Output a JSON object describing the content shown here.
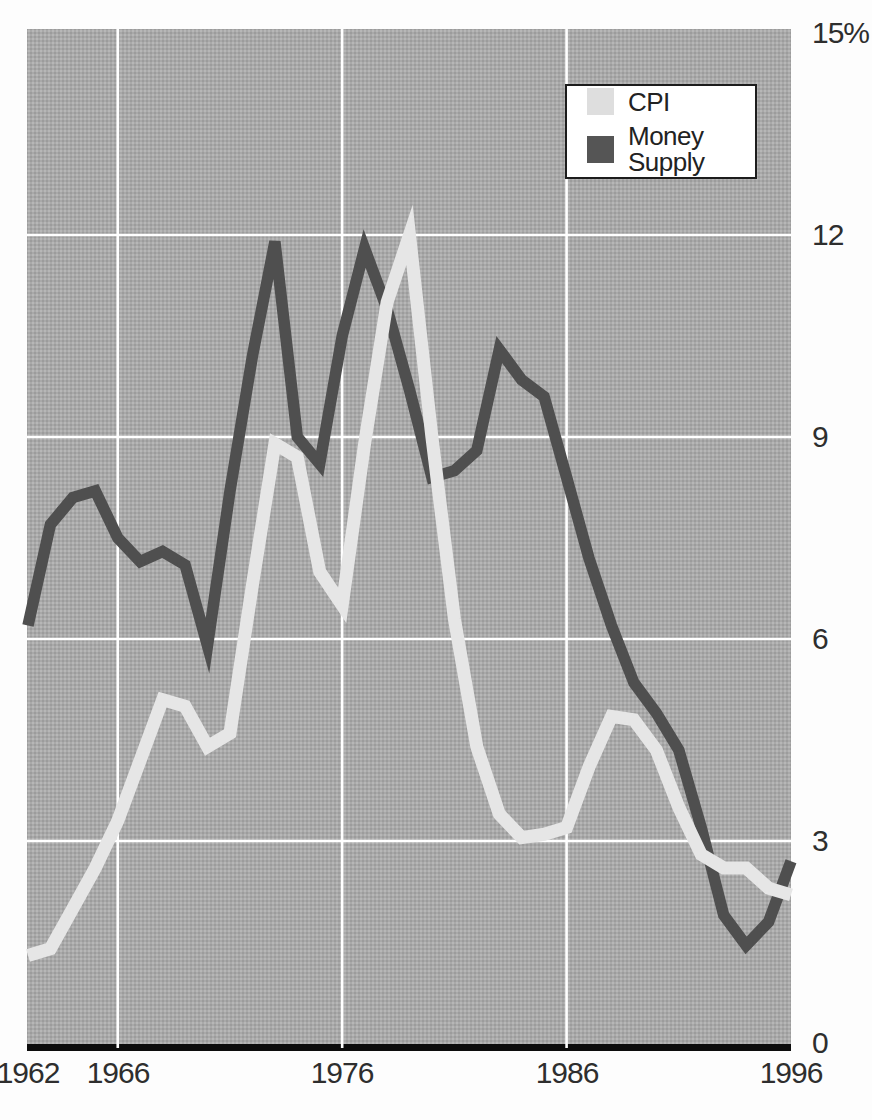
{
  "chart_data": {
    "type": "line",
    "title": "",
    "xlabel": "",
    "ylabel": "",
    "xlim": [
      1962,
      1996
    ],
    "ylim": [
      0,
      15
    ],
    "grid_on": true,
    "legend_position": "top-right",
    "plot_bg_color": "#a9a9a9",
    "grid_color": "#ffffff",
    "baseline_color": "#0d0d0d",
    "x": [
      1962,
      1963,
      1964,
      1965,
      1966,
      1967,
      1968,
      1969,
      1970,
      1971,
      1972,
      1973,
      1974,
      1975,
      1976,
      1977,
      1978,
      1979,
      1980,
      1981,
      1982,
      1983,
      1984,
      1985,
      1986,
      1987,
      1988,
      1989,
      1990,
      1991,
      1992,
      1993,
      1994,
      1995,
      1996
    ],
    "series": [
      {
        "name": "CPI",
        "color": "#e6e6e6",
        "values": [
          1.3,
          1.4,
          2.0,
          2.6,
          3.3,
          4.2,
          5.1,
          5.0,
          4.4,
          4.6,
          6.8,
          8.9,
          8.7,
          7.0,
          6.5,
          8.9,
          11.0,
          12.0,
          9.0,
          6.3,
          4.4,
          3.4,
          3.05,
          3.1,
          3.2,
          4.1,
          4.85,
          4.8,
          4.35,
          3.5,
          2.8,
          2.6,
          2.6,
          2.3,
          2.2
        ]
      },
      {
        "name": "Money Supply",
        "color": "#4f4f4f",
        "values": [
          6.2,
          7.7,
          8.1,
          8.2,
          7.5,
          7.15,
          7.3,
          7.1,
          5.9,
          8.2,
          10.2,
          11.9,
          9.0,
          8.6,
          10.5,
          11.8,
          10.9,
          9.7,
          8.4,
          8.5,
          8.8,
          10.3,
          9.85,
          9.6,
          8.4,
          7.2,
          6.2,
          5.35,
          4.9,
          4.35,
          3.2,
          1.9,
          1.45,
          1.8,
          2.7
        ]
      }
    ],
    "y_ticks": [
      {
        "value": 0,
        "label": "0"
      },
      {
        "value": 3,
        "label": "3"
      },
      {
        "value": 6,
        "label": "6"
      },
      {
        "value": 9,
        "label": "9"
      },
      {
        "value": 12,
        "label": "12"
      },
      {
        "value": 15,
        "label": "15%"
      }
    ],
    "x_ticks": [
      {
        "value": 1962,
        "label": "1962"
      },
      {
        "value": 1966,
        "label": "1966"
      },
      {
        "value": 1976,
        "label": "1976"
      },
      {
        "value": 1986,
        "label": "1986"
      },
      {
        "value": 1996,
        "label": "1996"
      }
    ],
    "grid_x_values": [
      1966,
      1976,
      1986
    ],
    "grid_y_values": [
      3,
      6,
      9,
      12
    ]
  },
  "legend": {
    "items": [
      {
        "label": "CPI",
        "swatch_color": "#dedede"
      },
      {
        "label": "Money Supply",
        "swatch_color": "#555555"
      }
    ]
  }
}
